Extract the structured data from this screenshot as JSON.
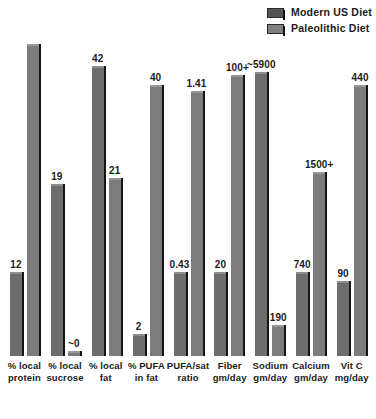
{
  "legend": {
    "position": "top-right",
    "items": [
      {
        "label": "Modern US Diet",
        "key": "modern",
        "color": "#6d6d6d",
        "swatch": "legend-swatch-modern"
      },
      {
        "label": "Paleolithic Diet",
        "key": "paleo",
        "color": "#7c7c7c",
        "swatch": "legend-swatch-paleo"
      }
    ]
  },
  "chart_data": {
    "type": "bar",
    "title": "",
    "subtitle": "",
    "xlabel": "",
    "ylabel": "",
    "grid": false,
    "legend_position": "top-right",
    "note": "Each category uses its own independent vertical scale; printed data labels carry the values.",
    "categories": [
      "% local protein",
      "% local sucrose",
      "% local fat",
      "% PUFA in fat",
      "PUFA/sat ratio",
      "Fiber gm/day",
      "Sodium gm/day",
      "Calcium gm/day",
      "Vit C mg/day"
    ],
    "category_lines": [
      [
        "% local",
        "protein"
      ],
      [
        "% local",
        "sucrose"
      ],
      [
        "% local",
        "fat"
      ],
      [
        "% PUFA",
        "in fat"
      ],
      [
        "PUFA/sat",
        "ratio"
      ],
      [
        "Fiber",
        "gm/day"
      ],
      [
        "Sodium",
        "gm/day"
      ],
      [
        "Calcium",
        "gm/day"
      ],
      [
        "Vit C",
        "mg/day"
      ]
    ],
    "series": [
      {
        "name": "Modern US Diet",
        "key": "modern",
        "color": "#6d6d6d",
        "values": [
          12,
          19,
          42,
          2,
          0.43,
          20,
          5900,
          740,
          90
        ],
        "labels": [
          "12",
          "19",
          "42",
          "2",
          "0.43",
          "20",
          "~5900",
          "740",
          "90"
        ],
        "heights_pct": [
          27,
          55,
          93,
          7,
          27,
          27,
          91,
          27,
          24
        ]
      },
      {
        "name": "Paleolithic Diet",
        "key": "paleo",
        "color": "#7c7c7c",
        "values": [
          33,
          0,
          21,
          40,
          1.41,
          100,
          190,
          1500,
          440
        ],
        "labels": [
          "",
          "~0",
          "21",
          "40",
          "1.41",
          "100+",
          "190",
          "1500+",
          "440"
        ],
        "heights_pct": [
          100,
          1.5,
          57,
          87,
          85,
          90,
          10,
          59,
          87
        ]
      }
    ]
  }
}
